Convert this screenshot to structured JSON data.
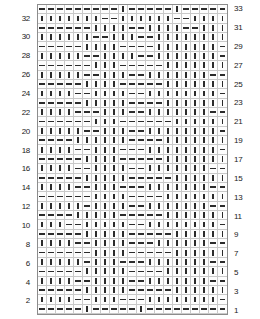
{
  "chart_data": {
    "type": "heatmap",
    "xlabel": "",
    "ylabel": "",
    "columns": 21,
    "rows": 33,
    "grid": true,
    "legend_position": "none",
    "symbols": {
      "dash": "purl",
      "bar": "knit"
    },
    "symbol_glyphs": {
      "dash": "—",
      "bar": "|"
    },
    "row_labels_left": [
      "32",
      "30",
      "28",
      "26",
      "24",
      "22",
      "20",
      "18",
      "16",
      "14",
      "12",
      "10",
      "8",
      "6",
      "4",
      "2"
    ],
    "row_labels_right": [
      "33",
      "31",
      "29",
      "27",
      "25",
      "23",
      "21",
      "19",
      "17",
      "15",
      "13",
      "11",
      "9",
      "7",
      "5",
      "3",
      "1"
    ],
    "axis_left_label": "even rows",
    "axis_right_label": "odd rows",
    "cells": [
      "---------|-----|------",
      "|||||||--||||||--|||||",
      "------||||--||||--||||",
      "||||||--|||--|||||||||",
      "-----||||----|||||||-|",
      "|||||--||||--|||||||-|",
      "------|||-----||||||||",
      "|||||--|||--|||||||--|",
      "-----||||-----||||||||",
      "||||--||||--||||||||-|",
      "-----|||||----|||||||-",
      "||||---|||--|||||||--|",
      "------|||------|||||||",
      "|||||--|||--||||||||--",
      "----||||||----||||||||",
      "||||--|||---||||||||-|",
      "-----||||-----|||||||-",
      "||||--||||--|||||||--|",
      "-----|||||-----|||||||",
      "||||--|||---|||||||--|",
      "------||||----||||||||",
      "|||||-||||--|||||||--|",
      "----|||||-----||||||||",
      "|||--|||||--||||||||-|",
      "-----|||||-----|||||||",
      "||||--||||---||||||--|",
      "------||||-----|||||||",
      "|||||-|||---|||||||--|",
      "-----|||||----||||||||",
      "||||--||||--|||||||---",
      "-----|||||-----|||||||",
      "||||--|||---||||||||-|",
      "-----|-----|---------|"
    ]
  }
}
